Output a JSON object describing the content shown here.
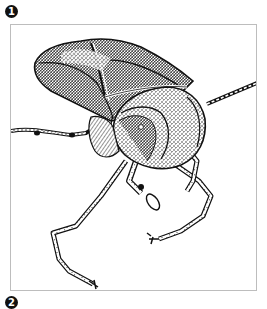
{
  "figure": {
    "labels": [
      {
        "index": 1,
        "glyph": "1"
      },
      {
        "index": 2,
        "glyph": "2"
      }
    ],
    "illustration": {
      "subject": "shield-bug-ink-drawing",
      "style": "pen-and-ink stipple",
      "colors": {
        "ink": "#111111",
        "frame_border": "#bdbdbd",
        "background": "#ffffff"
      }
    }
  }
}
